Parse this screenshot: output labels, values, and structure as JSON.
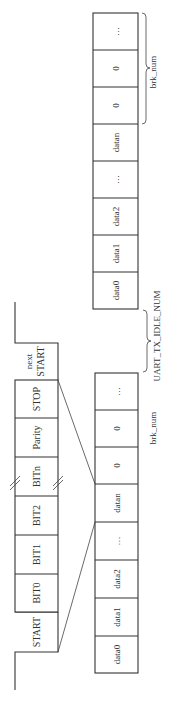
{
  "diagram": {
    "orientation": "rotated-90-ccw",
    "colors": {
      "line": "#333333",
      "background": "#ffffff",
      "text": "#333333"
    },
    "frame": {
      "cells": [
        "START",
        "BIT0",
        "BIT1",
        "BIT2",
        "BITn",
        "Parity",
        "STOP"
      ],
      "next_start": {
        "line1": "next",
        "line2": "START"
      }
    },
    "lower_strip": {
      "cells": [
        "data0",
        "data1",
        "data2",
        "…",
        "datan",
        "0",
        "0",
        "…"
      ],
      "brace_label": "brk_num",
      "gap_label": "UART_TX_IDLE_NUM"
    },
    "upper_strip": {
      "cells": [
        "data0",
        "data1",
        "data2",
        "…",
        "datan",
        "0",
        "0",
        "…"
      ],
      "brace_label": "brk_num"
    }
  }
}
